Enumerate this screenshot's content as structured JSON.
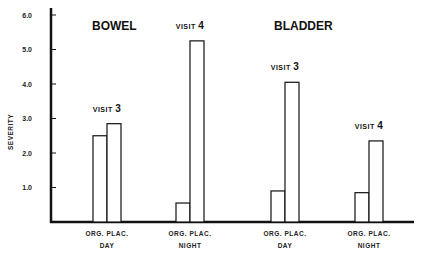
{
  "chart_data": {
    "type": "bar",
    "title": "",
    "xlabel": "",
    "ylabel": "SEVERITY",
    "ylim": [
      0,
      6.0
    ],
    "yticks": [
      "1.0",
      "2.0",
      "3.0",
      "4.0",
      "5.0",
      "6.0"
    ],
    "grid": false,
    "legend": "none",
    "panels": [
      {
        "name": "BOWEL",
        "groups": [
          {
            "period": "DAY",
            "visit_label": "VISIT",
            "visit_number": "3",
            "bars": [
              {
                "label": "ORG.",
                "value": 2.5
              },
              {
                "label": "PLAC.",
                "value": 2.85
              }
            ]
          },
          {
            "period": "NIGHT",
            "visit_label": "VISIT",
            "visit_number": "4",
            "bars": [
              {
                "label": "ORG.",
                "value": 0.55
              },
              {
                "label": "PLAC.",
                "value": 5.25
              }
            ]
          }
        ]
      },
      {
        "name": "BLADDER",
        "groups": [
          {
            "period": "DAY",
            "visit_label": "VISIT",
            "visit_number": "3",
            "bars": [
              {
                "label": "ORG.",
                "value": 0.9
              },
              {
                "label": "PLAC.",
                "value": 4.05
              }
            ]
          },
          {
            "period": "NIGHT",
            "visit_label": "VISIT",
            "visit_number": "4",
            "bars": [
              {
                "label": "ORG.",
                "value": 0.85
              },
              {
                "label": "PLAC.",
                "value": 2.35
              }
            ]
          }
        ]
      }
    ]
  }
}
